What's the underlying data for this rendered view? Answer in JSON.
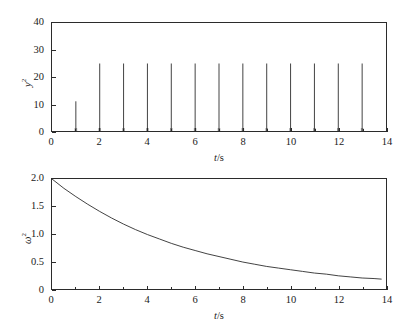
{
  "figure": {
    "background_color": "#ffffff",
    "line_color": "#2b2b2b",
    "panels": [
      {
        "id": "top",
        "xlabel_symbol": "t",
        "xlabel_unit": "/s",
        "ylabel_symbol": "y",
        "ylabel_exponent": "2",
        "y_ticks": [
          "0",
          "10",
          "20",
          "30",
          "40"
        ],
        "x_ticks": [
          "0",
          "2",
          "4",
          "6",
          "8",
          "10",
          "12",
          "14"
        ]
      },
      {
        "id": "bottom",
        "xlabel_symbol": "t",
        "xlabel_unit": "/s",
        "ylabel_symbol": "ω",
        "ylabel_exponent": "2",
        "y_ticks": [
          "0",
          "0.5",
          "1.0",
          "1.5",
          "2.0"
        ],
        "x_ticks": [
          "0",
          "2",
          "4",
          "6",
          "8",
          "10",
          "12",
          "14"
        ]
      }
    ]
  },
  "chart_data": [
    {
      "type": "bar",
      "panel": "top",
      "title": "",
      "xlabel": "t/s",
      "ylabel": "y²",
      "xlim": [
        0,
        14
      ],
      "ylim": [
        0,
        40
      ],
      "grid": false,
      "legend": "none",
      "x_major_ticks": [
        0,
        2,
        4,
        6,
        8,
        10,
        12,
        14
      ],
      "x_minor_ticks": [
        1,
        3,
        5,
        7,
        9,
        11,
        13
      ],
      "y_major_ticks": [
        0,
        10,
        20,
        30,
        40
      ],
      "description": "Train of narrow impulses at each integer second; first impulse is lower than the rest.",
      "x": [
        1,
        2,
        3,
        4,
        5,
        6,
        7,
        8,
        9,
        10,
        11,
        12,
        13
      ],
      "values": [
        11,
        25,
        25,
        25,
        25,
        25,
        25,
        25,
        25,
        25,
        25,
        25,
        25
      ]
    },
    {
      "type": "line",
      "panel": "bottom",
      "title": "",
      "xlabel": "t/s",
      "ylabel": "ω²",
      "xlim": [
        0,
        14
      ],
      "ylim": [
        0,
        2.0
      ],
      "grid": false,
      "legend": "none",
      "x_major_ticks": [
        0,
        2,
        4,
        6,
        8,
        10,
        12,
        14
      ],
      "x_minor_ticks": [
        1,
        3,
        5,
        7,
        9,
        11,
        13
      ],
      "y_major_ticks": [
        0,
        0.5,
        1.0,
        1.5,
        2.0
      ],
      "description": "Monotonic exponential decay starting at 2.0 and flattening near 0.17.",
      "x": [
        0,
        0.5,
        1,
        1.5,
        2,
        2.5,
        3,
        3.5,
        4,
        4.5,
        5,
        5.5,
        6,
        6.5,
        7,
        7.5,
        8,
        8.5,
        9,
        9.5,
        10,
        10.5,
        11,
        11.5,
        12,
        12.5,
        13,
        13.5,
        13.8
      ],
      "values": [
        2.0,
        1.83,
        1.68,
        1.54,
        1.41,
        1.29,
        1.18,
        1.08,
        0.99,
        0.91,
        0.83,
        0.76,
        0.7,
        0.64,
        0.59,
        0.54,
        0.49,
        0.45,
        0.41,
        0.38,
        0.35,
        0.32,
        0.29,
        0.27,
        0.24,
        0.22,
        0.2,
        0.19,
        0.18
      ]
    }
  ]
}
